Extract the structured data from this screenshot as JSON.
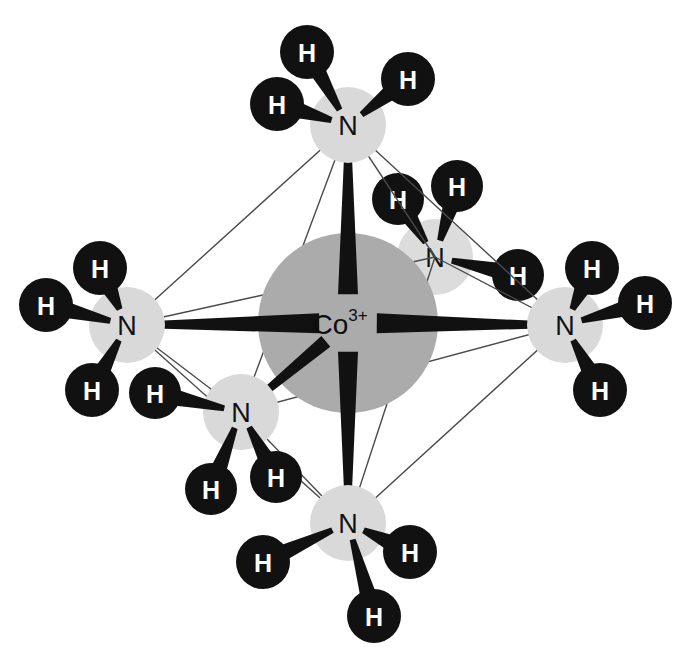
{
  "figure": {
    "background_color": "#ffffff",
    "width": 680,
    "height": 662
  },
  "palette": {
    "metal_sphere": "#ababab",
    "metal_sphere_back": "#b4b4b4",
    "nitrogen_sphere": "#d9d9d9",
    "nitrogen_sphere_back": "#dcdcdc",
    "hydrogen_sphere": "#111111",
    "bond_dark": "#111111",
    "wireframe_edge": "#4a4a4a",
    "label_dark": "#111111",
    "label_light": "#ffffff"
  },
  "center_atom": {
    "name": "cobalt-center",
    "element": "Co",
    "charge": "3+",
    "label": "Co",
    "charge_label": "3+",
    "cx": 348,
    "cy": 323,
    "r": 90,
    "color": "#ababab"
  },
  "nitrogen_atoms": [
    {
      "id": "n-top",
      "element": "N",
      "label": "N",
      "cx": 348,
      "cy": 125,
      "r": 38,
      "depth": "front",
      "color": "#d9d9d9",
      "hydrogens": [
        {
          "id": "n-top-h1",
          "label": "H",
          "cx": 307,
          "cy": 52,
          "r": 27
        },
        {
          "id": "n-top-h2",
          "label": "H",
          "cx": 277,
          "cy": 104,
          "r": 27
        },
        {
          "id": "n-top-h3",
          "label": "H",
          "cx": 408,
          "cy": 79,
          "r": 27
        }
      ]
    },
    {
      "id": "n-left",
      "element": "N",
      "label": "N",
      "cx": 127,
      "cy": 325,
      "r": 38,
      "depth": "front",
      "color": "#d9d9d9",
      "hydrogens": [
        {
          "id": "n-left-h1",
          "label": "H",
          "cx": 100,
          "cy": 268,
          "r": 27
        },
        {
          "id": "n-left-h2",
          "label": "H",
          "cx": 46,
          "cy": 305,
          "r": 27
        },
        {
          "id": "n-left-h3",
          "label": "H",
          "cx": 92,
          "cy": 390,
          "r": 27
        }
      ]
    },
    {
      "id": "n-right",
      "element": "N",
      "label": "N",
      "cx": 565,
      "cy": 325,
      "r": 38,
      "depth": "front",
      "color": "#d9d9d9",
      "hydrogens": [
        {
          "id": "n-right-h1",
          "label": "H",
          "cx": 592,
          "cy": 268,
          "r": 27
        },
        {
          "id": "n-right-h2",
          "label": "H",
          "cx": 645,
          "cy": 303,
          "r": 27
        },
        {
          "id": "n-right-h3",
          "label": "H",
          "cx": 600,
          "cy": 390,
          "r": 27
        }
      ]
    },
    {
      "id": "n-bottom",
      "element": "N",
      "label": "N",
      "cx": 348,
      "cy": 523,
      "r": 38,
      "depth": "front",
      "color": "#d9d9d9",
      "hydrogens": [
        {
          "id": "n-bottom-h1",
          "label": "H",
          "cx": 263,
          "cy": 562,
          "r": 27
        },
        {
          "id": "n-bottom-h2",
          "label": "H",
          "cx": 410,
          "cy": 552,
          "r": 27
        },
        {
          "id": "n-bottom-h3",
          "label": "H",
          "cx": 374,
          "cy": 616,
          "r": 27
        }
      ]
    },
    {
      "id": "n-back-right",
      "element": "N",
      "label": "N",
      "cx": 435,
      "cy": 257,
      "r": 38,
      "depth": "back",
      "color": "#dcdcdc",
      "hydrogens": [
        {
          "id": "n-back-right-h1",
          "label": "H",
          "cx": 398,
          "cy": 199,
          "r": 26
        },
        {
          "id": "n-back-right-h2",
          "label": "H",
          "cx": 457,
          "cy": 186,
          "r": 26
        },
        {
          "id": "n-back-right-h3",
          "label": "H",
          "cx": 518,
          "cy": 275,
          "r": 26
        }
      ]
    },
    {
      "id": "n-front-left",
      "element": "N",
      "label": "N",
      "cx": 241,
      "cy": 412,
      "r": 38,
      "depth": "front",
      "color": "#d9d9d9",
      "hydrogens": [
        {
          "id": "n-front-left-h1",
          "label": "H",
          "cx": 155,
          "cy": 393,
          "r": 26
        },
        {
          "id": "n-front-left-h2",
          "label": "H",
          "cx": 211,
          "cy": 489,
          "r": 26
        },
        {
          "id": "n-front-left-h3",
          "label": "H",
          "cx": 276,
          "cy": 477,
          "r": 26
        }
      ]
    }
  ],
  "wireframe_edges": [
    {
      "id": "edge-top-left",
      "from": "n-top",
      "to": "n-left"
    },
    {
      "id": "edge-top-right",
      "from": "n-top",
      "to": "n-right"
    },
    {
      "id": "edge-top-back-right",
      "from": "n-top",
      "to": "n-back-right"
    },
    {
      "id": "edge-top-front-left",
      "from": "n-top",
      "to": "n-front-left"
    },
    {
      "id": "edge-bottom-left",
      "from": "n-bottom",
      "to": "n-left"
    },
    {
      "id": "edge-bottom-right",
      "from": "n-bottom",
      "to": "n-right"
    },
    {
      "id": "edge-bottom-back-right",
      "from": "n-bottom",
      "to": "n-back-right"
    },
    {
      "id": "edge-bottom-front-left",
      "from": "n-bottom",
      "to": "n-front-left"
    },
    {
      "id": "edge-left-back-right",
      "from": "n-left",
      "to": "n-back-right"
    },
    {
      "id": "edge-left-front-left",
      "from": "n-left",
      "to": "n-front-left"
    },
    {
      "id": "edge-right-back-right",
      "from": "n-right",
      "to": "n-back-right"
    },
    {
      "id": "edge-right-front-left",
      "from": "n-right",
      "to": "n-front-left"
    }
  ],
  "metal_bonds": [
    {
      "id": "bond-co-n-top",
      "to": "n-top"
    },
    {
      "id": "bond-co-n-bottom",
      "to": "n-bottom"
    },
    {
      "id": "bond-co-n-left",
      "to": "n-left"
    },
    {
      "id": "bond-co-n-right",
      "to": "n-right"
    },
    {
      "id": "bond-co-n-back-right",
      "to": "n-back-right"
    },
    {
      "id": "bond-co-n-front-left",
      "to": "n-front-left"
    }
  ]
}
